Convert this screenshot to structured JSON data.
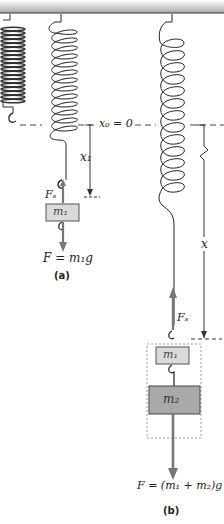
{
  "labels": {
    "x0": "x₀ = 0",
    "x1": "x₁",
    "x": "x",
    "fs_a": "Fₛ",
    "fs_b": "Fₛ",
    "m1_a": "m₁",
    "m1_b": "m₁",
    "m2_b": "m₂",
    "force_a": "F = m₁g",
    "force_b": "F = (m₁ + m₂)g",
    "caption_a": "(a)",
    "caption_b": "(b)"
  },
  "colors": {
    "ceiling": "#b0b0b0",
    "spring": "#222222",
    "mass_m1": "#d8d8d8",
    "mass_m2": "#a8a8a8",
    "arrow": "#7a7a7a"
  }
}
